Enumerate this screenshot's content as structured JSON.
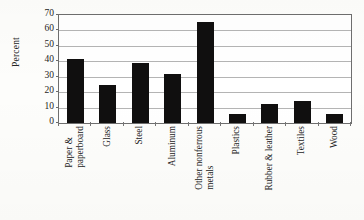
{
  "chart_data": {
    "type": "bar",
    "title": "",
    "xlabel": "",
    "ylabel": "Percent",
    "ylim": [
      0,
      70
    ],
    "ytick_interval": 10,
    "yticks": [
      70,
      60,
      50,
      40,
      30,
      20,
      10,
      0
    ],
    "grid": true,
    "legend": false,
    "legend_position": "none",
    "bar_color": "#100f0f",
    "categories": [
      "Paper & paperboard",
      "Glass",
      "Steel",
      "Aluminum",
      "Other nonferrous metals",
      "Plastics",
      "Rubber & leather",
      "Textiles",
      "Wood"
    ],
    "values": [
      41.8,
      24.5,
      38.8,
      31.5,
      65.5,
      6.0,
      12.5,
      14.0,
      6.0
    ]
  },
  "axis": {
    "y_title": "Percent",
    "y_tick_labels": [
      "70",
      "60",
      "50",
      "40",
      "30",
      "20",
      "10",
      "0"
    ],
    "x_tick_labels": [
      {
        "line1": "Paper &",
        "line2": "paperboard"
      },
      {
        "line1": "Glass",
        "line2": ""
      },
      {
        "line1": "Steel",
        "line2": ""
      },
      {
        "line1": "Aluminum",
        "line2": ""
      },
      {
        "line1": "Other nonferrous",
        "line2": "metals"
      },
      {
        "line1": "Plastics",
        "line2": ""
      },
      {
        "line1": "Rubber & leather",
        "line2": ""
      },
      {
        "line1": "Textiles",
        "line2": ""
      },
      {
        "line1": "Wood",
        "line2": ""
      }
    ]
  },
  "style": {
    "plot_background": "#ffffff",
    "page_background": "#fdfdfb",
    "gridline_color": "#b4b4b4",
    "frame_color": "#6e6e6e"
  }
}
